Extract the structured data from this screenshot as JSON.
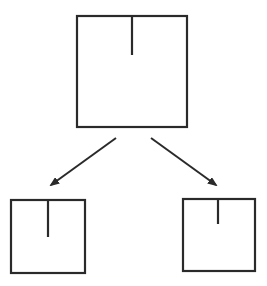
{
  "diagram": {
    "stroke_color": "#2a2a2a",
    "background": "#ffffff",
    "nodes": [
      {
        "id": "parent",
        "x": 77,
        "y": 16,
        "w": 110,
        "h": 111,
        "divider_x": 132,
        "divider_len": 39
      },
      {
        "id": "child-left",
        "x": 11,
        "y": 200,
        "w": 74,
        "h": 73,
        "divider_x": 48,
        "divider_len": 37
      },
      {
        "id": "child-right",
        "x": 183,
        "y": 199,
        "w": 72,
        "h": 72,
        "divider_x": 218,
        "divider_len": 25
      }
    ],
    "edges": [
      {
        "from": "parent",
        "to": "child-left",
        "x1": 116,
        "y1": 138,
        "x2": 51,
        "y2": 185
      },
      {
        "from": "parent",
        "to": "child-right",
        "x1": 151,
        "y1": 138,
        "x2": 216,
        "y2": 185
      }
    ]
  }
}
